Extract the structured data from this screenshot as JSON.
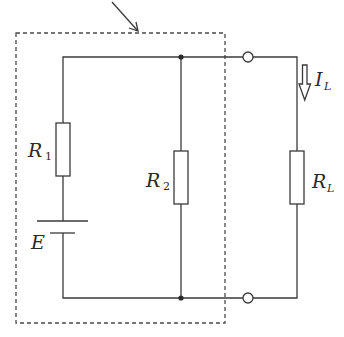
{
  "diagram": {
    "type": "circuit",
    "colors": {
      "line": "#3a3a3a",
      "dashed_box": "#4a4a4a",
      "background": "#ffffff"
    },
    "labels": {
      "r1": {
        "main": "R",
        "sub": "1"
      },
      "r2": {
        "main": "R",
        "sub": "2"
      },
      "rl": {
        "main": "R",
        "sub": "L"
      },
      "il": {
        "main": "I",
        "sub": "L"
      },
      "e": {
        "main": "E"
      }
    },
    "components": [
      {
        "id": "R1",
        "kind": "resistor",
        "branch": "left"
      },
      {
        "id": "E",
        "kind": "battery",
        "branch": "left"
      },
      {
        "id": "R2",
        "kind": "resistor",
        "branch": "middle"
      },
      {
        "id": "RL",
        "kind": "resistor",
        "branch": "right"
      },
      {
        "id": "IL",
        "kind": "current-arrow",
        "direction": "down",
        "branch": "right"
      }
    ],
    "terminals": 2,
    "junctions": 2,
    "dashed_box": "encloses E, R1, R2",
    "pointer_arrow": "points to dashed box top edge"
  }
}
